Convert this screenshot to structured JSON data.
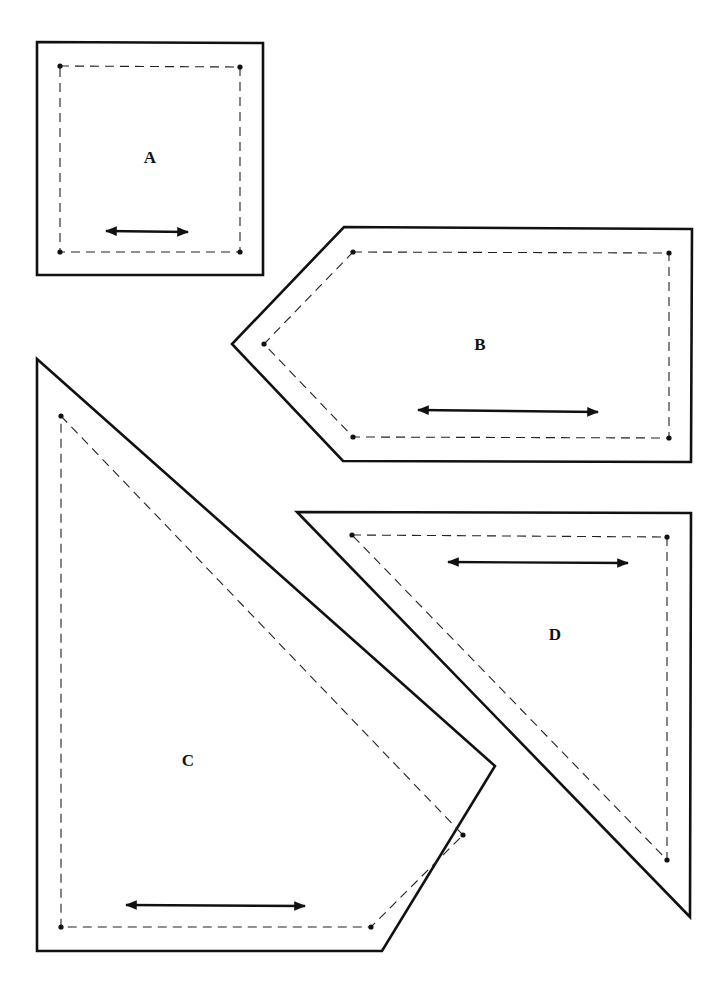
{
  "colors": {
    "line": "#111111",
    "background": "#ffffff"
  },
  "pieces": [
    {
      "label": "A",
      "shape": "rectangle",
      "cut_line": [
        [
          37,
          42
        ],
        [
          263,
          43
        ],
        [
          263,
          275
        ],
        [
          37,
          275
        ]
      ],
      "seam_line": [
        [
          60,
          66
        ],
        [
          240,
          67
        ],
        [
          240,
          252
        ],
        [
          60,
          252
        ]
      ],
      "grain_arrow": [
        [
          106,
          231
        ],
        [
          188,
          232
        ]
      ],
      "label_pos": [
        150,
        163
      ]
    },
    {
      "label": "B",
      "shape": "pentagon",
      "cut_line": [
        [
          344,
          227
        ],
        [
          692,
          229
        ],
        [
          691,
          462
        ],
        [
          343,
          461
        ],
        [
          232,
          344
        ]
      ],
      "seam_line": [
        [
          353,
          252
        ],
        [
          669,
          253
        ],
        [
          669,
          438
        ],
        [
          353,
          437
        ],
        [
          264,
          344
        ]
      ],
      "grain_arrow": [
        [
          418,
          410
        ],
        [
          598,
          412
        ]
      ],
      "label_pos": [
        480,
        350
      ]
    },
    {
      "label": "C",
      "shape": "pentagon",
      "cut_line": [
        [
          37,
          359
        ],
        [
          495,
          766
        ],
        [
          382,
          951
        ],
        [
          37,
          951
        ]
      ],
      "seam_line": [
        [
          61,
          416
        ],
        [
          463,
          835
        ],
        [
          371,
          927
        ],
        [
          61,
          927
        ]
      ],
      "grain_arrow": [
        [
          126,
          905
        ],
        [
          305,
          906
        ]
      ],
      "label_pos": [
        188,
        766
      ]
    },
    {
      "label": "D",
      "shape": "triangle",
      "cut_line": [
        [
          297,
          512
        ],
        [
          691,
          513
        ],
        [
          690,
          917
        ]
      ],
      "seam_line": [
        [
          352,
          535
        ],
        [
          667,
          537
        ],
        [
          667,
          860
        ]
      ],
      "grain_arrow": [
        [
          448,
          562
        ],
        [
          628,
          563
        ]
      ],
      "label_pos": [
        555,
        640
      ]
    }
  ]
}
